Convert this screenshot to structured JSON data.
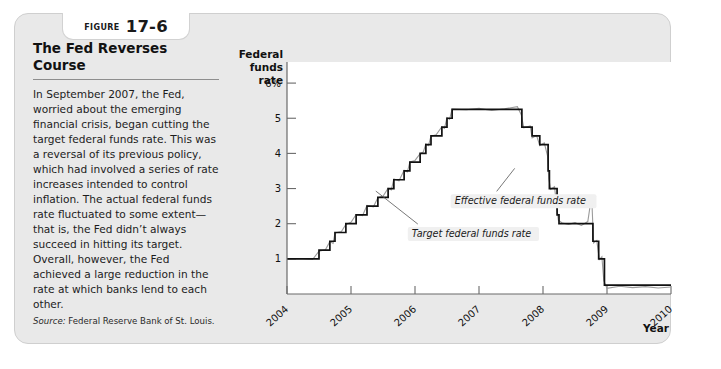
{
  "figure": {
    "label": "Figure",
    "number": "17-6",
    "title": "The Fed Reverses Course",
    "body": "In September 2007, the Fed, worried about the emerging financial crisis, began cutting the target federal funds rate. This was a reversal of its previous policy, which had involved a series of rate increases intended to control inflation. The actual federal funds rate fluctuated to some extent—that is, the Fed didn’t always succeed in hitting its target. Overall, however, the Fed achieved a large reduction in the rate at which banks lend to each other.",
    "source_label": "Source:",
    "source_text": "Federal Reserve Bank of St. Louis."
  },
  "chart_data": {
    "type": "line",
    "title": "The Fed Reverses Course",
    "xlabel": "Year",
    "ylabel": "Federal funds rate",
    "ylabel_lines": [
      "Federal",
      "funds",
      "rate"
    ],
    "xlim": [
      2004,
      2010
    ],
    "ylim": [
      0,
      6.6
    ],
    "grid": false,
    "ytick_labels": [
      "6%",
      "5",
      "4",
      "3",
      "2",
      "1"
    ],
    "ytick_values": [
      6,
      5,
      4,
      3,
      2,
      1
    ],
    "xtick_labels": [
      "2004",
      "2005",
      "2006",
      "2007",
      "2008",
      "2009",
      "2010"
    ],
    "xtick_values": [
      2004,
      2005,
      2006,
      2007,
      2008,
      2009,
      2010
    ],
    "legend_position": "inline-annotations",
    "annotations": [
      {
        "text": "Effective federal funds rate",
        "x": 2006.62,
        "y": 2.55
      },
      {
        "text": "Target federal funds rate",
        "x": 2005.95,
        "y": 1.62
      }
    ],
    "series": [
      {
        "name": "Target federal funds rate",
        "color": "#111111",
        "style": "step",
        "points": [
          [
            2004.0,
            1.0
          ],
          [
            2004.5,
            1.0
          ],
          [
            2004.5,
            1.25
          ],
          [
            2004.67,
            1.25
          ],
          [
            2004.67,
            1.5
          ],
          [
            2004.75,
            1.5
          ],
          [
            2004.75,
            1.75
          ],
          [
            2004.92,
            1.75
          ],
          [
            2004.92,
            2.0
          ],
          [
            2005.08,
            2.0
          ],
          [
            2005.08,
            2.25
          ],
          [
            2005.25,
            2.25
          ],
          [
            2005.25,
            2.5
          ],
          [
            2005.42,
            2.5
          ],
          [
            2005.42,
            2.75
          ],
          [
            2005.58,
            2.75
          ],
          [
            2005.58,
            3.0
          ],
          [
            2005.67,
            3.0
          ],
          [
            2005.67,
            3.25
          ],
          [
            2005.83,
            3.25
          ],
          [
            2005.83,
            3.5
          ],
          [
            2005.92,
            3.5
          ],
          [
            2005.92,
            3.75
          ],
          [
            2006.08,
            3.75
          ],
          [
            2006.08,
            4.0
          ],
          [
            2006.17,
            4.0
          ],
          [
            2006.17,
            4.25
          ],
          [
            2006.25,
            4.25
          ],
          [
            2006.25,
            4.5
          ],
          [
            2006.42,
            4.5
          ],
          [
            2006.42,
            4.75
          ],
          [
            2006.5,
            4.75
          ],
          [
            2006.5,
            5.0
          ],
          [
            2006.58,
            5.0
          ],
          [
            2006.58,
            5.25
          ],
          [
            2007.67,
            5.25
          ],
          [
            2007.67,
            4.75
          ],
          [
            2007.83,
            4.75
          ],
          [
            2007.83,
            4.5
          ],
          [
            2007.95,
            4.5
          ],
          [
            2007.95,
            4.25
          ],
          [
            2008.08,
            4.25
          ],
          [
            2008.08,
            3.5
          ],
          [
            2008.1,
            3.5
          ],
          [
            2008.1,
            3.0
          ],
          [
            2008.22,
            3.0
          ],
          [
            2008.22,
            2.25
          ],
          [
            2008.25,
            2.25
          ],
          [
            2008.25,
            2.0
          ],
          [
            2008.42,
            2.0
          ],
          [
            2008.42,
            2.0
          ],
          [
            2008.78,
            2.0
          ],
          [
            2008.78,
            1.5
          ],
          [
            2008.87,
            1.5
          ],
          [
            2008.87,
            1.0
          ],
          [
            2008.96,
            1.0
          ],
          [
            2008.96,
            0.25
          ],
          [
            2010.0,
            0.25
          ]
        ]
      },
      {
        "name": "Effective federal funds rate",
        "color": "#9b9b9b",
        "style": "noisy-line",
        "points": [
          [
            2004.0,
            1.0
          ],
          [
            2004.2,
            1.01
          ],
          [
            2004.4,
            0.98
          ],
          [
            2004.5,
            1.22
          ],
          [
            2004.6,
            1.26
          ],
          [
            2004.67,
            1.49
          ],
          [
            2004.72,
            1.44
          ],
          [
            2004.75,
            1.74
          ],
          [
            2004.85,
            1.78
          ],
          [
            2004.92,
            1.98
          ],
          [
            2005.0,
            2.04
          ],
          [
            2005.08,
            2.26
          ],
          [
            2005.18,
            2.23
          ],
          [
            2005.25,
            2.52
          ],
          [
            2005.35,
            2.48
          ],
          [
            2005.42,
            2.74
          ],
          [
            2005.5,
            2.78
          ],
          [
            2005.58,
            3.01
          ],
          [
            2005.63,
            2.96
          ],
          [
            2005.67,
            3.27
          ],
          [
            2005.75,
            3.22
          ],
          [
            2005.83,
            3.52
          ],
          [
            2005.88,
            3.47
          ],
          [
            2005.92,
            3.76
          ],
          [
            2006.0,
            3.8
          ],
          [
            2006.08,
            3.99
          ],
          [
            2006.13,
            4.04
          ],
          [
            2006.17,
            4.27
          ],
          [
            2006.21,
            4.22
          ],
          [
            2006.25,
            4.49
          ],
          [
            2006.33,
            4.53
          ],
          [
            2006.42,
            4.76
          ],
          [
            2006.46,
            4.71
          ],
          [
            2006.5,
            5.02
          ],
          [
            2006.54,
            4.97
          ],
          [
            2006.58,
            5.26
          ],
          [
            2006.8,
            5.24
          ],
          [
            2007.0,
            5.28
          ],
          [
            2007.2,
            5.22
          ],
          [
            2007.4,
            5.27
          ],
          [
            2007.6,
            5.33
          ],
          [
            2007.66,
            5.1
          ],
          [
            2007.7,
            4.73
          ],
          [
            2007.8,
            4.78
          ],
          [
            2007.83,
            4.44
          ],
          [
            2007.9,
            4.51
          ],
          [
            2007.95,
            4.22
          ],
          [
            2008.02,
            4.3
          ],
          [
            2008.07,
            3.94
          ],
          [
            2008.09,
            3.28
          ],
          [
            2008.12,
            2.98
          ],
          [
            2008.18,
            3.05
          ],
          [
            2008.22,
            2.4
          ],
          [
            2008.24,
            2.1
          ],
          [
            2008.3,
            2.02
          ],
          [
            2008.4,
            1.98
          ],
          [
            2008.5,
            2.03
          ],
          [
            2008.6,
            1.95
          ],
          [
            2008.7,
            2.06
          ],
          [
            2008.76,
            2.8
          ],
          [
            2008.79,
            1.45
          ],
          [
            2008.84,
            1.52
          ],
          [
            2008.88,
            0.98
          ],
          [
            2008.92,
            1.06
          ],
          [
            2008.95,
            0.38
          ],
          [
            2009.0,
            0.16
          ],
          [
            2009.2,
            0.22
          ],
          [
            2009.4,
            0.18
          ],
          [
            2009.6,
            0.21
          ],
          [
            2009.8,
            0.17
          ],
          [
            2010.0,
            0.2
          ]
        ]
      }
    ]
  }
}
